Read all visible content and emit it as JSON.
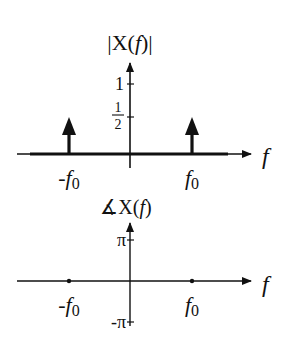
{
  "magnitude_plot": {
    "title_prefix": "|X(",
    "title_var": "f",
    "title_suffix": ")|",
    "x_axis_label": "f",
    "y_ticks": [
      {
        "label": "1",
        "value": 1
      },
      {
        "label_num": "1",
        "label_den": "2",
        "value": 0.5
      }
    ],
    "x_ticks": [
      {
        "sign": "-",
        "var": "f",
        "sub": "0"
      },
      {
        "sign": "",
        "var": "f",
        "sub": "0"
      }
    ],
    "impulses": [
      {
        "at": "-f0",
        "area": 0.5
      },
      {
        "at": "f0",
        "area": 0.5
      }
    ]
  },
  "phase_plot": {
    "title_angle": "∡",
    "title_prefix": "X(",
    "title_var": "f",
    "title_suffix": ")",
    "x_axis_label": "f",
    "y_ticks": [
      {
        "label": "π",
        "value": "pi"
      },
      {
        "label": "-π",
        "value": "-pi"
      }
    ],
    "x_ticks": [
      {
        "sign": "-",
        "var": "f",
        "sub": "0"
      },
      {
        "sign": "",
        "var": "f",
        "sub": "0"
      }
    ],
    "points": [
      {
        "at": "-f0",
        "phase": 0
      },
      {
        "at": "f0",
        "phase": 0
      }
    ]
  },
  "colors": {
    "ink": "#111111",
    "background": "#ffffff"
  }
}
